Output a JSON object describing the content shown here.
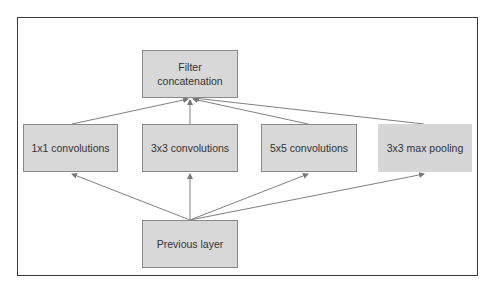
{
  "diagram": {
    "type": "flowchart",
    "nodes": {
      "concat": {
        "label": "Filter\nconcatenation",
        "line1": "Filter",
        "line2": "concatenation"
      },
      "conv1": {
        "label": "1x1 convolutions"
      },
      "conv3": {
        "label": "3x3 convolutions"
      },
      "conv5": {
        "label": "5x5 convolutions"
      },
      "pool": {
        "label": "3x3 max pooling"
      },
      "prev": {
        "label": "Previous layer"
      }
    },
    "edges": [
      {
        "from": "prev",
        "to": "conv1"
      },
      {
        "from": "prev",
        "to": "conv3"
      },
      {
        "from": "prev",
        "to": "conv5"
      },
      {
        "from": "prev",
        "to": "pool"
      },
      {
        "from": "conv1",
        "to": "concat"
      },
      {
        "from": "conv3",
        "to": "concat"
      },
      {
        "from": "conv5",
        "to": "concat"
      },
      {
        "from": "pool",
        "to": "concat"
      }
    ],
    "colors": {
      "box_fill": "#d8d8d8",
      "box_border": "#8a8a8a",
      "edge": "#777777",
      "frame": "#3a3a3a"
    }
  }
}
